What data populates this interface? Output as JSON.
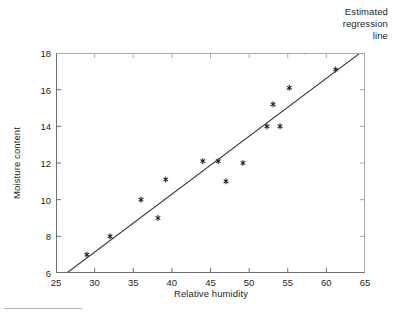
{
  "figure": {
    "annotation_lines": [
      "Estimated",
      "regression",
      "line"
    ],
    "marker_glyph": "asterisk-marker",
    "line_color": "#3b3b3b",
    "marker_color": "#231f20",
    "axis_color": "#6d6e71",
    "footer_rule": "footer-rule"
  },
  "chart_data": {
    "type": "scatter",
    "title": "",
    "subtitle": "",
    "xlabel": "Relative humidity",
    "ylabel": "Moisture content",
    "xlim": [
      25,
      65
    ],
    "ylim": [
      6,
      18
    ],
    "xticks": [
      25,
      30,
      35,
      40,
      45,
      50,
      55,
      60,
      65
    ],
    "yticks": [
      6,
      8,
      10,
      12,
      14,
      16,
      18
    ],
    "xtick_labels": [
      "25",
      "30",
      "35",
      "40",
      "45",
      "50",
      "55",
      "60",
      "65"
    ],
    "ytick_labels": [
      "6",
      "8",
      "10",
      "12",
      "14",
      "16",
      "18"
    ],
    "grid": false,
    "legend_position": "none",
    "annotations": [
      {
        "text": "Estimated regression line",
        "target": "regression-line",
        "position": "top-right-outside"
      }
    ],
    "series": [
      {
        "name": "Observations",
        "type": "scatter",
        "marker": "asterisk",
        "x": [
          29.0,
          32.0,
          36.0,
          38.2,
          39.2,
          44.0,
          46.0,
          47.0,
          49.2,
          52.3,
          53.1,
          54.0,
          55.2,
          57.2,
          61.2
        ],
        "y": [
          7.0,
          8.0,
          10.0,
          9.0,
          11.1,
          12.1,
          12.1,
          11.0,
          12.0,
          14.0,
          15.2,
          14.0,
          16.1,
          18.1,
          17.1
        ]
      },
      {
        "name": "Estimated regression line",
        "type": "line",
        "x": [
          26.4,
          65.0
        ],
        "y": [
          6.0,
          18.2
        ]
      }
    ]
  }
}
